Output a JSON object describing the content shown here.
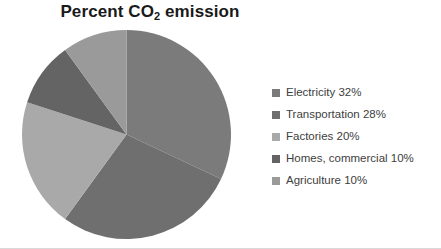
{
  "chart_data": {
    "type": "pie",
    "title": "Percent CO2 emission",
    "title_main": "Percent CO",
    "title_sub": "2",
    "title_tail": " emission",
    "categories": [
      "Electricity",
      "Transportation",
      "Factories",
      "Homes, commercial",
      "Agriculture"
    ],
    "values": [
      32,
      28,
      20,
      10,
      10
    ],
    "unit": "%",
    "start_angle_deg": 0,
    "direction": "clockwise",
    "legend_position": "right",
    "grid": false,
    "colors": [
      "#7b7b7b",
      "#6f6f6f",
      "#a9a9a9",
      "#646464",
      "#9a9a9a"
    ],
    "background": "#ffffff",
    "slices": [
      {
        "label": "Electricity",
        "value": 32,
        "legend": "Electricity 32%",
        "color": "#7b7b7b"
      },
      {
        "label": "Transportation",
        "value": 28,
        "legend": "Transportation 28%",
        "color": "#6f6f6f"
      },
      {
        "label": "Factories",
        "value": 20,
        "legend": "Factories 20%",
        "color": "#a9a9a9"
      },
      {
        "label": "Homes, commercial",
        "value": 10,
        "legend": "Homes, commercial 10%",
        "color": "#646464"
      },
      {
        "label": "Agriculture",
        "value": 10,
        "legend": "Agriculture 10%",
        "color": "#9a9a9a"
      }
    ]
  },
  "legend": {
    "items": [
      {
        "label": "Electricity 32%"
      },
      {
        "label": "Transportation 28%"
      },
      {
        "label": "Factories 20%"
      },
      {
        "label": "Homes, commercial 10%"
      },
      {
        "label": "Agriculture 10%"
      }
    ]
  }
}
